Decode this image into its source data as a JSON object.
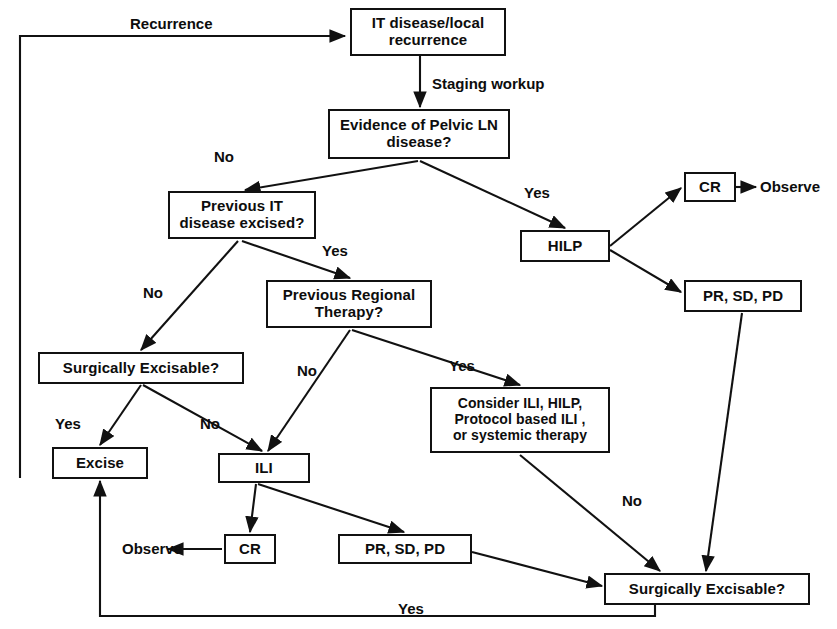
{
  "diagram": {
    "nodes": [
      {
        "id": "it_disease",
        "label": "IT disease/local\nrecurrence",
        "x": 350,
        "y": 8,
        "w": 156,
        "h": 48,
        "font": "fs15"
      },
      {
        "id": "pelvic_ln",
        "label": "Evidence of Pelvic LN\ndisease?",
        "x": 328,
        "y": 109,
        "w": 182,
        "h": 50,
        "font": "fs15"
      },
      {
        "id": "prev_it",
        "label": "Previous IT\ndisease excised?",
        "x": 168,
        "y": 191,
        "w": 148,
        "h": 48,
        "font": "fs15"
      },
      {
        "id": "hilp",
        "label": "HILP",
        "x": 520,
        "y": 230,
        "w": 90,
        "h": 32,
        "font": "fs15"
      },
      {
        "id": "cr_top",
        "label": "CR",
        "x": 684,
        "y": 172,
        "w": 52,
        "h": 30,
        "font": "fs15"
      },
      {
        "id": "pr_sd_pd_top",
        "label": "PR, SD, PD",
        "x": 684,
        "y": 280,
        "w": 118,
        "h": 32,
        "font": "fs15"
      },
      {
        "id": "prev_regional",
        "label": "Previous Regional\nTherapy?",
        "x": 266,
        "y": 280,
        "w": 166,
        "h": 48,
        "font": "fs15"
      },
      {
        "id": "surg_exc_mid",
        "label": "Surgically Excisable?",
        "x": 38,
        "y": 352,
        "w": 206,
        "h": 32,
        "font": "fs15"
      },
      {
        "id": "consider",
        "label": "Consider ILI, HILP,\nProtocol based ILI ,\nor systemic therapy",
        "x": 430,
        "y": 387,
        "w": 180,
        "h": 66,
        "font": "fs14"
      },
      {
        "id": "excise",
        "label": "Excise",
        "x": 52,
        "y": 447,
        "w": 96,
        "h": 32,
        "font": "fs15"
      },
      {
        "id": "ili",
        "label": "ILI",
        "x": 218,
        "y": 453,
        "w": 92,
        "h": 30,
        "font": "fs15"
      },
      {
        "id": "cr_bottom",
        "label": "CR",
        "x": 224,
        "y": 534,
        "w": 52,
        "h": 30,
        "font": "fs15"
      },
      {
        "id": "pr_sd_pd_bottom",
        "label": "PR, SD, PD",
        "x": 338,
        "y": 534,
        "w": 134,
        "h": 30,
        "font": "fs15"
      },
      {
        "id": "surg_exc_bottom",
        "label": "Surgically Excisable?",
        "x": 604,
        "y": 573,
        "w": 206,
        "h": 32,
        "font": "fs15"
      }
    ],
    "free_labels": [
      {
        "id": "observe_top",
        "text": "Observe",
        "x": 760,
        "y": 178,
        "font": "fs15"
      },
      {
        "id": "observe_bottom",
        "text": "Observe",
        "x": 122,
        "y": 540,
        "font": "fs15"
      }
    ],
    "edge_labels": [
      {
        "id": "recurrence",
        "text": "Recurrence",
        "x": 130,
        "y": 15,
        "font": "fs15"
      },
      {
        "id": "staging_workup",
        "text": "Staging workup",
        "x": 432,
        "y": 75,
        "font": "fs15"
      },
      {
        "id": "no_pelvic",
        "text": "No",
        "x": 214,
        "y": 148,
        "font": "fs15"
      },
      {
        "id": "yes_pelvic",
        "text": "Yes",
        "x": 524,
        "y": 184,
        "font": "fs15"
      },
      {
        "id": "yes_prev_it",
        "text": "Yes",
        "x": 322,
        "y": 242,
        "font": "fs15"
      },
      {
        "id": "no_prev_it",
        "text": "No",
        "x": 143,
        "y": 284,
        "font": "fs15"
      },
      {
        "id": "no_prev_regional",
        "text": "No",
        "x": 297,
        "y": 362,
        "font": "fs15"
      },
      {
        "id": "yes_prev_regional",
        "text": "Yes",
        "x": 449,
        "y": 357,
        "font": "fs15"
      },
      {
        "id": "yes_surg_mid",
        "text": "Yes",
        "x": 55,
        "y": 415,
        "font": "fs15"
      },
      {
        "id": "no_surg_mid",
        "text": "No",
        "x": 200,
        "y": 415,
        "font": "fs15"
      },
      {
        "id": "no_consider",
        "text": "No",
        "x": 622,
        "y": 492,
        "font": "fs15"
      },
      {
        "id": "yes_bottom_return",
        "text": "Yes",
        "x": 398,
        "y": 600,
        "font": "fs15"
      }
    ],
    "edges": [
      {
        "id": "recurrence-to-it-disease",
        "type": "poly",
        "points": "20,36 20,478 20,36 345,36",
        "arrow": "end"
      },
      {
        "id": "it-disease-to-pelvic-ln",
        "type": "poly",
        "points": "420,56 420,107",
        "arrow": "end"
      },
      {
        "id": "pelvic-ln-to-prev-it",
        "type": "poly",
        "points": "418,161 245,190",
        "arrow": "end"
      },
      {
        "id": "pelvic-ln-to-hilp",
        "type": "poly",
        "points": "420,161 565,228",
        "arrow": "end"
      },
      {
        "id": "hilp-to-cr",
        "type": "poly",
        "points": "610,246 681,188",
        "arrow": "end"
      },
      {
        "id": "hilp-to-pr-sd-pd",
        "type": "poly",
        "points": "610,250 681,292",
        "arrow": "end"
      },
      {
        "id": "cr-to-observe",
        "type": "poly",
        "points": "736,187 756,187",
        "arrow": "end"
      },
      {
        "id": "prev-it-to-prev-regional",
        "type": "poly",
        "points": "242,241 350,278",
        "arrow": "end"
      },
      {
        "id": "prev-it-to-surg-exc-mid",
        "type": "poly",
        "points": "238,241 141,350",
        "arrow": "end"
      },
      {
        "id": "prev-regional-to-ili",
        "type": "poly",
        "points": "350,330 268,451",
        "arrow": "end"
      },
      {
        "id": "prev-regional-to-consider",
        "type": "poly",
        "points": "352,330 520,385",
        "arrow": "end"
      },
      {
        "id": "surg-exc-mid-to-excise",
        "type": "poly",
        "points": "141,385 100,445",
        "arrow": "end"
      },
      {
        "id": "surg-exc-mid-to-ili",
        "type": "poly",
        "points": "143,385 262,451",
        "arrow": "end"
      },
      {
        "id": "ili-to-cr-bottom",
        "type": "poly",
        "points": "256,484 250,532",
        "arrow": "end"
      },
      {
        "id": "ili-to-pr-sd-pd-bottom",
        "type": "poly",
        "points": "258,484 404,532",
        "arrow": "end"
      },
      {
        "id": "cr-bottom-to-observe",
        "type": "poly",
        "points": "222,549 168,549",
        "arrow": "end"
      },
      {
        "id": "pr-sd-pd-bottom-to-surg-bottom",
        "type": "poly",
        "points": "472,552 602,586",
        "arrow": "end"
      },
      {
        "id": "consider-to-surg-bottom",
        "type": "poly",
        "points": "520,455 660,571",
        "arrow": "end"
      },
      {
        "id": "pr-sd-pd-top-to-surg-bottom",
        "type": "poly",
        "points": "742,313 706,571",
        "arrow": "end"
      },
      {
        "id": "surg-bottom-to-excise-return",
        "type": "poly",
        "points": "655,605 655,616 100,616 100,481",
        "arrow": "end"
      }
    ]
  }
}
